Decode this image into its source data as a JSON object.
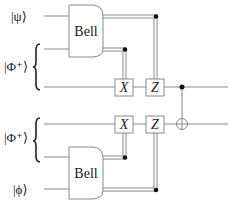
{
  "diagram": {
    "type": "quantum-circuit",
    "inputs": [
      {
        "id": "psi",
        "label": "|ψ⟩"
      },
      {
        "id": "phi_plus_top",
        "label": "|Φ⁺⟩"
      },
      {
        "id": "phi_plus_bottom",
        "label": "|Φ⁺⟩"
      },
      {
        "id": "phi",
        "label": "|ϕ⟩"
      }
    ],
    "gates": {
      "bell_top": "Bell",
      "bell_bottom": "Bell",
      "x_top": "X",
      "z_top": "Z",
      "x_bottom": "X",
      "z_bottom": "Z"
    },
    "cnot": {
      "control_wire": 3,
      "target_wire": 4
    },
    "colors": {
      "wire": "#8a8a8a",
      "text": "#222222",
      "dot": "#111111"
    }
  }
}
